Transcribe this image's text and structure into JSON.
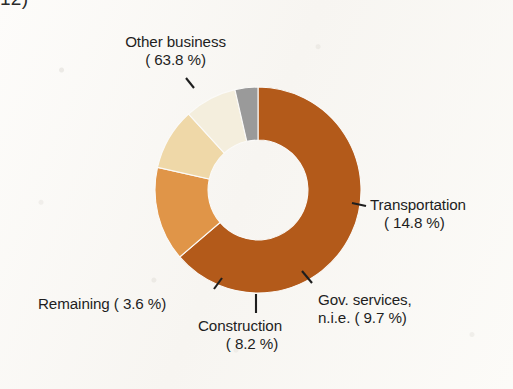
{
  "page": {
    "corner_fragment": "12)",
    "background_color": "#fbfaf8"
  },
  "chart_data": {
    "type": "pie",
    "variant": "donut",
    "title": "",
    "subtitle": "",
    "xlabel": "",
    "ylabel": "",
    "legend_position": "none",
    "labels_position": "outside-with-leader-lines",
    "grid": false,
    "units": "percent",
    "start_angle_deg": 0,
    "direction": "clockwise",
    "inner_radius_ratio": 0.485,
    "categories": [
      "Other business",
      "Transportation",
      "Gov. services, n.i.e.",
      "Construction",
      "Remaining"
    ],
    "values": [
      63.8,
      14.8,
      9.7,
      8.2,
      3.6
    ],
    "colors": [
      "#b35a1a",
      "#e09548",
      "#efd8a8",
      "#f4eedd",
      "#9a9a9a"
    ],
    "slices": [
      {
        "label": "Other business",
        "value": 63.8,
        "value_text": "63.8 %",
        "color": "#b35a1a"
      },
      {
        "label": "Transportation",
        "value": 14.8,
        "value_text": "14.8 %",
        "color": "#e09548"
      },
      {
        "label": "Gov. services, n.i.e.",
        "value": 9.7,
        "value_text": "9.7 %",
        "color": "#efd8a8"
      },
      {
        "label": "Construction",
        "value": 8.2,
        "value_text": "8.2 %",
        "color": "#f4eedd"
      },
      {
        "label": "Remaining",
        "value": 3.6,
        "value_text": "3.6 %",
        "color": "#9a9a9a"
      }
    ]
  },
  "labels": {
    "other_business": {
      "line1": "Other business",
      "line2": "( 63.8 %)"
    },
    "transportation": {
      "line1": "Transportation",
      "line2": "( 14.8 %)"
    },
    "gov_services": {
      "line1": "Gov. services,",
      "line2": "n.i.e. ( 9.7 %)"
    },
    "construction": {
      "line1": "Construction",
      "line2": "( 8.2 %)"
    },
    "remaining": {
      "line1": "Remaining (  3.6 %)",
      "line2": ""
    }
  }
}
